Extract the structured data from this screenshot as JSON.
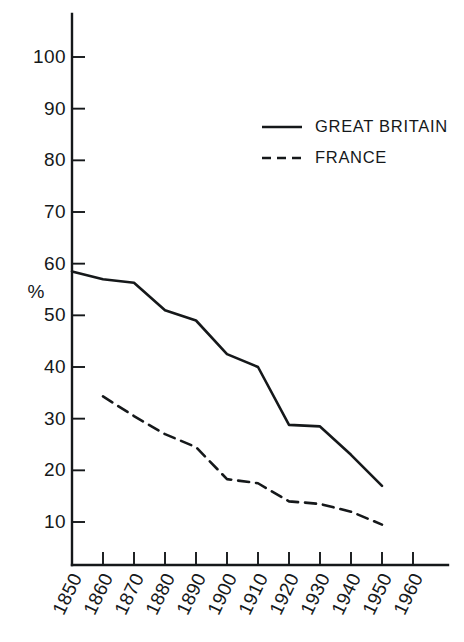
{
  "chart_data": {
    "type": "line",
    "title": "",
    "subtitle": "",
    "xlabel": "",
    "ylabel": "%",
    "x": [
      1850,
      1860,
      1870,
      1880,
      1890,
      1900,
      1910,
      1920,
      1930,
      1940,
      1950,
      1960
    ],
    "xtick_labels": [
      "1850",
      "1860",
      "1870",
      "1880",
      "1890",
      "1900",
      "1910",
      "1920",
      "1930",
      "1940",
      "1950",
      "1960"
    ],
    "ytick_labels": [
      "10",
      "20",
      "30",
      "40",
      "50",
      "60",
      "70",
      "80",
      "90",
      "100"
    ],
    "ytick_values": [
      10,
      20,
      30,
      40,
      50,
      60,
      70,
      80,
      90,
      100
    ],
    "xlim": [
      1850,
      1960
    ],
    "ylim": [
      0,
      105
    ],
    "grid": false,
    "legend_position": "upper-right",
    "series": [
      {
        "name": "GREAT BRITAIN",
        "style": "solid",
        "color": "#15181a",
        "x": [
          1850,
          1860,
          1870,
          1880,
          1890,
          1900,
          1910,
          1920,
          1930,
          1940,
          1950
        ],
        "values": [
          58.5,
          57.0,
          56.3,
          51.0,
          49.0,
          42.5,
          40.0,
          28.8,
          28.5,
          23.0,
          17.0
        ]
      },
      {
        "name": "FRANCE",
        "style": "dashed",
        "color": "#15181a",
        "x": [
          1860,
          1870,
          1880,
          1890,
          1900,
          1910,
          1920,
          1930,
          1940,
          1950
        ],
        "values": [
          34.3,
          30.5,
          27.0,
          24.5,
          18.3,
          17.5,
          14.0,
          13.5,
          12.0,
          9.5
        ]
      }
    ]
  },
  "legend": {
    "entries": [
      {
        "label": "GREAT BRITAIN",
        "style": "solid"
      },
      {
        "label": "FRANCE",
        "style": "dashed"
      }
    ]
  },
  "axes": {
    "y_title": "%"
  }
}
